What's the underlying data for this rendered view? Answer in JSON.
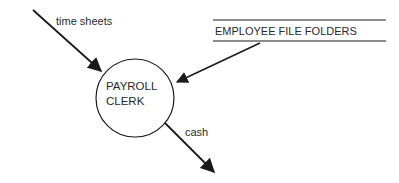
{
  "diagram": {
    "type": "data-flow-diagram",
    "process": {
      "label_line1": "PAYROLL",
      "label_line2": "CLERK"
    },
    "data_store": {
      "label": "EMPLOYEE FILE FOLDERS"
    },
    "flows": [
      {
        "label": "time sheets",
        "direction": "in"
      },
      {
        "label": "",
        "direction": "in",
        "from": "EMPLOYEE FILE FOLDERS"
      },
      {
        "label": "cash",
        "direction": "out"
      }
    ],
    "colors": {
      "stroke": "#1a1a1a",
      "text": "#2a2a2a",
      "background": "#ffffff"
    }
  }
}
